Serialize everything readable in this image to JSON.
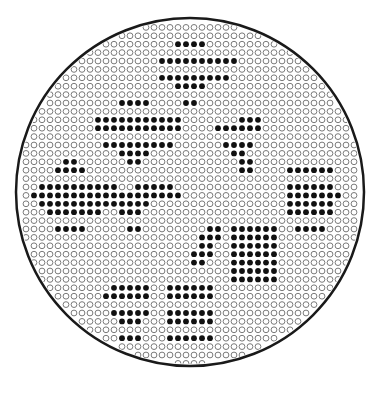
{
  "figure": {
    "width": 379,
    "height": 401,
    "circle": {
      "cx": 190,
      "cy": 192,
      "r": 174,
      "stroke": "#1a1a1a",
      "stroke_width": 2.5
    },
    "grid": {
      "x0": 18,
      "y0": 19,
      "dx": 8,
      "dy": 8.4,
      "dot_r": 2.9,
      "open_stroke": "#7a7a7a",
      "filled_color": "#111111"
    },
    "background": "#ffffff",
    "clusters": [
      {
        "name": "top-center-diamond",
        "rows": [
          [
            40,
            189,
            197
          ],
          [
            48,
            181,
            205
          ],
          [
            57,
            173,
            213
          ],
          [
            65,
            165,
            221
          ],
          [
            74,
            165,
            221
          ],
          [
            82,
            173,
            213
          ],
          [
            90,
            181,
            205
          ],
          [
            99,
            189,
            197
          ]
        ]
      },
      {
        "name": "upper-left-diamond",
        "rows": [
          [
            99,
            133,
            141
          ],
          [
            107,
            125,
            149
          ],
          [
            116,
            117,
            165
          ],
          [
            124,
            101,
            181
          ],
          [
            132,
            101,
            181
          ],
          [
            141,
            109,
            173
          ],
          [
            149,
            117,
            165
          ],
          [
            157,
            125,
            149
          ],
          [
            166,
            133,
            141
          ]
        ]
      },
      {
        "name": "left-diamond",
        "rows": [
          [
            166,
            69,
            77
          ],
          [
            174,
            61,
            85
          ],
          [
            183,
            53,
            101
          ],
          [
            191,
            45,
            117
          ],
          [
            199,
            37,
            125
          ],
          [
            208,
            45,
            117
          ],
          [
            216,
            53,
            101
          ],
          [
            225,
            61,
            85
          ],
          [
            233,
            69,
            77
          ]
        ]
      },
      {
        "name": "center-chevron",
        "rows": [
          [
            183,
            157,
            165
          ],
          [
            191,
            141,
            173
          ],
          [
            199,
            109,
            181
          ],
          [
            208,
            117,
            149
          ],
          [
            216,
            125,
            141
          ],
          [
            225,
            133,
            141
          ],
          [
            233,
            133,
            141
          ]
        ]
      },
      {
        "name": "upper-right-chevron",
        "rows": [
          [
            124,
            245,
            261
          ],
          [
            132,
            221,
            261
          ],
          [
            141,
            229,
            253
          ],
          [
            149,
            237,
            245
          ],
          [
            157,
            237,
            245
          ],
          [
            166,
            245,
            253
          ],
          [
            174,
            245,
            253
          ]
        ]
      },
      {
        "name": "right-block",
        "rows": [
          [
            174,
            293,
            333
          ],
          [
            183,
            293,
            333
          ],
          [
            191,
            293,
            333
          ],
          [
            199,
            293,
            341
          ],
          [
            208,
            293,
            333
          ],
          [
            216,
            293,
            333
          ],
          [
            225,
            301,
            325
          ]
        ]
      },
      {
        "name": "mid-right-block",
        "rows": [
          [
            233,
            237,
            277
          ],
          [
            241,
            237,
            277
          ],
          [
            250,
            237,
            277
          ],
          [
            258,
            237,
            277
          ],
          [
            266,
            237,
            277
          ],
          [
            275,
            237,
            277
          ],
          [
            283,
            237,
            277
          ]
        ]
      },
      {
        "name": "mid-center-sliver",
        "rows": [
          [
            233,
            213,
            221
          ],
          [
            241,
            205,
            221
          ],
          [
            250,
            205,
            213
          ],
          [
            258,
            197,
            213
          ],
          [
            266,
            197,
            205
          ]
        ]
      },
      {
        "name": "lower-center-block",
        "rows": [
          [
            292,
            173,
            213
          ],
          [
            300,
            173,
            213
          ],
          [
            309,
            173,
            213
          ],
          [
            317,
            173,
            213
          ],
          [
            325,
            173,
            213
          ],
          [
            334,
            173,
            213
          ],
          [
            342,
            173,
            205
          ]
        ]
      },
      {
        "name": "lower-left-sliver",
        "rows": [
          [
            292,
            117,
            149
          ],
          [
            300,
            109,
            149
          ],
          [
            309,
            117,
            149
          ],
          [
            317,
            117,
            141
          ],
          [
            325,
            125,
            141
          ],
          [
            334,
            125,
            141
          ],
          [
            342,
            125,
            133
          ]
        ]
      },
      {
        "name": "top-right-fragment",
        "rows": [
          [
            57,
            213,
            221
          ],
          [
            65,
            213,
            237
          ],
          [
            74,
            205,
            229
          ],
          [
            82,
            205,
            221
          ]
        ]
      }
    ]
  }
}
